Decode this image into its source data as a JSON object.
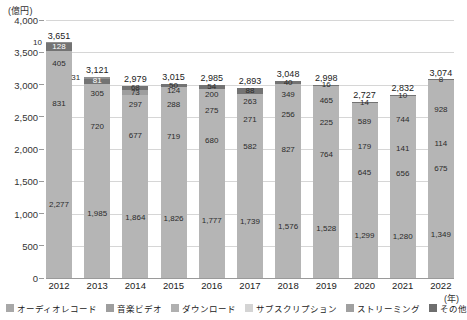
{
  "axis": {
    "unit_label": "(億円)",
    "x_unit_label": "(年)",
    "y_ticks": [
      "4,000",
      "3,500",
      "3,000",
      "2,500",
      "2,000",
      "1,500",
      "1,000",
      "500",
      "0"
    ]
  },
  "chart_data": {
    "type": "bar",
    "stacked": true,
    "title": "",
    "xlabel": "(年)",
    "ylabel": "(億円)",
    "ylim": [
      0,
      4000
    ],
    "ytick_step": 500,
    "grid": true,
    "legend_position": "bottom",
    "categories": [
      "2012",
      "2013",
      "2014",
      "2015",
      "2016",
      "2017",
      "2018",
      "2019",
      "2020",
      "2021",
      "2022"
    ],
    "series": [
      {
        "name": "オーディオレコード",
        "color": "#a8a8a8",
        "values": [
          2277,
          1985,
          1864,
          1826,
          1777,
          1739,
          1576,
          1528,
          1299,
          1280,
          1349
        ]
      },
      {
        "name": "音楽ビデオ",
        "color": "#b0b0b0",
        "values": [
          831,
          720,
          677,
          719,
          680,
          582,
          827,
          764,
          645,
          656,
          675
        ]
      },
      {
        "name": "ダウンロード",
        "color": "#bdbdbd",
        "values": [
          405,
          305,
          297,
          288,
          275,
          271,
          256,
          225,
          179,
          141,
          114
        ]
      },
      {
        "name": "サブスクリプション",
        "color": "#cfcfcf",
        "values": [
          128,
          81,
          73,
          124,
          200,
          263,
          349,
          465,
          589,
          744,
          928
        ]
      },
      {
        "name": "ストリーミング",
        "color": "#8f8f8f",
        "values": [
          10,
          31,
          68,
          50,
          54,
          88,
          40,
          16,
          14,
          10,
          8
        ]
      },
      {
        "name": "その他",
        "color": "#6e6e6e",
        "values": [
          0,
          0,
          0,
          0,
          0,
          0,
          0,
          0,
          0,
          0,
          0
        ]
      }
    ],
    "totals": [
      3651,
      3121,
      2979,
      3015,
      2985,
      2893,
      3048,
      2998,
      2727,
      2832,
      3074
    ],
    "totals_labels": [
      "3,651",
      "3,121",
      "2,979",
      "3,015",
      "2,985",
      "2,893",
      "3,048",
      "2,998",
      "2,727",
      "2,832",
      "3,074"
    ],
    "bars": [
      {
        "year": "2012",
        "total": "3,651",
        "segments": [
          {
            "series": "ストリーミング",
            "label": "10",
            "value": 10,
            "color": "#8f8f8f",
            "style": "outside-left"
          },
          {
            "series": "サブスクリプション",
            "label": "128",
            "value": 128,
            "color": "#737373",
            "style": "dark"
          },
          {
            "series": "ダウンロード",
            "label": "405",
            "value": 405,
            "color": "#b5b5b5",
            "style": "normal"
          },
          {
            "series": "音楽ビデオ",
            "label": "831",
            "value": 831,
            "color": "#b5b5b5",
            "style": "normal"
          },
          {
            "series": "オーディオレコード",
            "label": "2,277",
            "value": 2277,
            "color": "#b5b5b5",
            "style": "normal"
          }
        ]
      },
      {
        "year": "2013",
        "total": "3,121",
        "segments": [
          {
            "series": "ストリーミング",
            "label": "31",
            "value": 31,
            "color": "#8f8f8f",
            "style": "outside-left"
          },
          {
            "series": "サブスクリプション",
            "label": "81",
            "value": 81,
            "color": "#737373",
            "style": "dark"
          },
          {
            "series": "ダウンロード",
            "label": "305",
            "value": 305,
            "color": "#b5b5b5",
            "style": "normal"
          },
          {
            "series": "音楽ビデオ",
            "label": "720",
            "value": 720,
            "color": "#b5b5b5",
            "style": "normal"
          },
          {
            "series": "オーディオレコード",
            "label": "1,985",
            "value": 1985,
            "color": "#b5b5b5",
            "style": "normal"
          }
        ]
      },
      {
        "year": "2014",
        "total": "2,979",
        "segments": [
          {
            "series": "ストリーミング",
            "label": "68",
            "value": 68,
            "color": "#737373",
            "style": "dark-tiny"
          },
          {
            "series": "サブスクリプション",
            "label": "73",
            "value": 73,
            "color": "#9e9e9e",
            "style": "tiny-top"
          },
          {
            "series": "ダウンロード",
            "label": "297",
            "value": 297,
            "color": "#b5b5b5",
            "style": "normal"
          },
          {
            "series": "音楽ビデオ",
            "label": "677",
            "value": 677,
            "color": "#b5b5b5",
            "style": "normal"
          },
          {
            "series": "オーディオレコード",
            "label": "1,864",
            "value": 1864,
            "color": "#b5b5b5",
            "style": "normal"
          }
        ]
      },
      {
        "year": "2015",
        "total": "3,015",
        "segments": [
          {
            "series": "ストリーミング",
            "label": "50",
            "value": 50,
            "color": "#737373",
            "style": "dark-tiny"
          },
          {
            "series": "サブスクリプション",
            "label": "124",
            "value": 124,
            "color": "#b5b5b5",
            "style": "normal"
          },
          {
            "series": "ダウンロード",
            "label": "288",
            "value": 288,
            "color": "#b5b5b5",
            "style": "normal"
          },
          {
            "series": "音楽ビデオ",
            "label": "719",
            "value": 719,
            "color": "#b5b5b5",
            "style": "normal"
          },
          {
            "series": "オーディオレコード",
            "label": "1,826",
            "value": 1826,
            "color": "#b5b5b5",
            "style": "normal"
          }
        ]
      },
      {
        "year": "2016",
        "total": "2,985",
        "segments": [
          {
            "series": "ストリーミング",
            "label": "54",
            "value": 54,
            "color": "#737373",
            "style": "dark-tiny"
          },
          {
            "series": "サブスクリプション",
            "label": "200",
            "value": 200,
            "color": "#b5b5b5",
            "style": "normal"
          },
          {
            "series": "ダウンロード",
            "label": "275",
            "value": 275,
            "color": "#b5b5b5",
            "style": "normal"
          },
          {
            "series": "音楽ビデオ",
            "label": "680",
            "value": 680,
            "color": "#b5b5b5",
            "style": "normal"
          },
          {
            "series": "オーディオレコード",
            "label": "1,777",
            "value": 1777,
            "color": "#b5b5b5",
            "style": "normal"
          }
        ]
      },
      {
        "year": "2017",
        "total": "2,893",
        "segments": [
          {
            "series": "ストリーミング",
            "label": "88",
            "value": 88,
            "color": "#737373",
            "style": "dark-tiny"
          },
          {
            "series": "サブスクリプション",
            "label": "263",
            "value": 263,
            "color": "#b5b5b5",
            "style": "normal"
          },
          {
            "series": "ダウンロード",
            "label": "271",
            "value": 271,
            "color": "#b5b5b5",
            "style": "normal"
          },
          {
            "series": "音楽ビデオ",
            "label": "582",
            "value": 582,
            "color": "#b5b5b5",
            "style": "normal"
          },
          {
            "series": "オーディオレコード",
            "label": "1,739",
            "value": 1739,
            "color": "#b5b5b5",
            "style": "normal"
          }
        ]
      },
      {
        "year": "2018",
        "total": "3,048",
        "segments": [
          {
            "series": "ストリーミング",
            "label": "40",
            "value": 40,
            "color": "#737373",
            "style": "dark-tiny"
          },
          {
            "series": "サブスクリプション",
            "label": "349",
            "value": 349,
            "color": "#b5b5b5",
            "style": "normal"
          },
          {
            "series": "ダウンロード",
            "label": "256",
            "value": 256,
            "color": "#b5b5b5",
            "style": "normal"
          },
          {
            "series": "音楽ビデオ",
            "label": "827",
            "value": 827,
            "color": "#b5b5b5",
            "style": "normal"
          },
          {
            "series": "オーディオレコード",
            "label": "1,576",
            "value": 1576,
            "color": "#b5b5b5",
            "style": "normal"
          }
        ]
      },
      {
        "year": "2019",
        "total": "2,998",
        "segments": [
          {
            "series": "ストリーミング",
            "label": "16",
            "value": 16,
            "color": "#737373",
            "style": "dark-tiny"
          },
          {
            "series": "サブスクリプション",
            "label": "465",
            "value": 465,
            "color": "#b5b5b5",
            "style": "normal"
          },
          {
            "series": "ダウンロード",
            "label": "225",
            "value": 225,
            "color": "#b5b5b5",
            "style": "normal"
          },
          {
            "series": "音楽ビデオ",
            "label": "764",
            "value": 764,
            "color": "#b5b5b5",
            "style": "normal"
          },
          {
            "series": "オーディオレコード",
            "label": "1,528",
            "value": 1528,
            "color": "#b5b5b5",
            "style": "normal"
          }
        ]
      },
      {
        "year": "2020",
        "total": "2,727",
        "segments": [
          {
            "series": "ストリーミング",
            "label": "14",
            "value": 14,
            "color": "#737373",
            "style": "dark-tiny"
          },
          {
            "series": "サブスクリプション",
            "label": "589",
            "value": 589,
            "color": "#b5b5b5",
            "style": "normal"
          },
          {
            "series": "ダウンロード",
            "label": "179",
            "value": 179,
            "color": "#b5b5b5",
            "style": "normal"
          },
          {
            "series": "音楽ビデオ",
            "label": "645",
            "value": 645,
            "color": "#b5b5b5",
            "style": "normal"
          },
          {
            "series": "オーディオレコード",
            "label": "1,299",
            "value": 1299,
            "color": "#b5b5b5",
            "style": "normal"
          }
        ]
      },
      {
        "year": "2021",
        "total": "2,832",
        "segments": [
          {
            "series": "ストリーミング",
            "label": "10",
            "value": 10,
            "color": "#737373",
            "style": "dark-tiny"
          },
          {
            "series": "サブスクリプション",
            "label": "744",
            "value": 744,
            "color": "#b5b5b5",
            "style": "normal"
          },
          {
            "series": "ダウンロード",
            "label": "141",
            "value": 141,
            "color": "#b5b5b5",
            "style": "normal"
          },
          {
            "series": "音楽ビデオ",
            "label": "656",
            "value": 656,
            "color": "#b5b5b5",
            "style": "normal"
          },
          {
            "series": "オーディオレコード",
            "label": "1,280",
            "value": 1280,
            "color": "#b5b5b5",
            "style": "normal"
          }
        ]
      },
      {
        "year": "2022",
        "total": "3,074",
        "segments": [
          {
            "series": "ストリーミング",
            "label": "8",
            "value": 8,
            "color": "#737373",
            "style": "dark-tiny"
          },
          {
            "series": "サブスクリプション",
            "label": "928",
            "value": 928,
            "color": "#b5b5b5",
            "style": "normal"
          },
          {
            "series": "ダウンロード",
            "label": "114",
            "value": 114,
            "color": "#b5b5b5",
            "style": "normal"
          },
          {
            "series": "音楽ビデオ",
            "label": "675",
            "value": 675,
            "color": "#b5b5b5",
            "style": "normal"
          },
          {
            "series": "オーディオレコード",
            "label": "1,349",
            "value": 1349,
            "color": "#b5b5b5",
            "style": "normal"
          }
        ]
      }
    ]
  },
  "legend": {
    "items": [
      {
        "label": "オーディオレコード",
        "color": "#a8a8a8"
      },
      {
        "label": "音楽ビデオ",
        "color": "#9e9e9e"
      },
      {
        "label": "ダウンロード",
        "color": "#b0b0b0"
      },
      {
        "label": "サブスクリプション",
        "color": "#d4d4d4"
      },
      {
        "label": "ストリーミング",
        "color": "#a0a0a0"
      },
      {
        "label": "その他",
        "color": "#6e6e6e"
      }
    ]
  }
}
